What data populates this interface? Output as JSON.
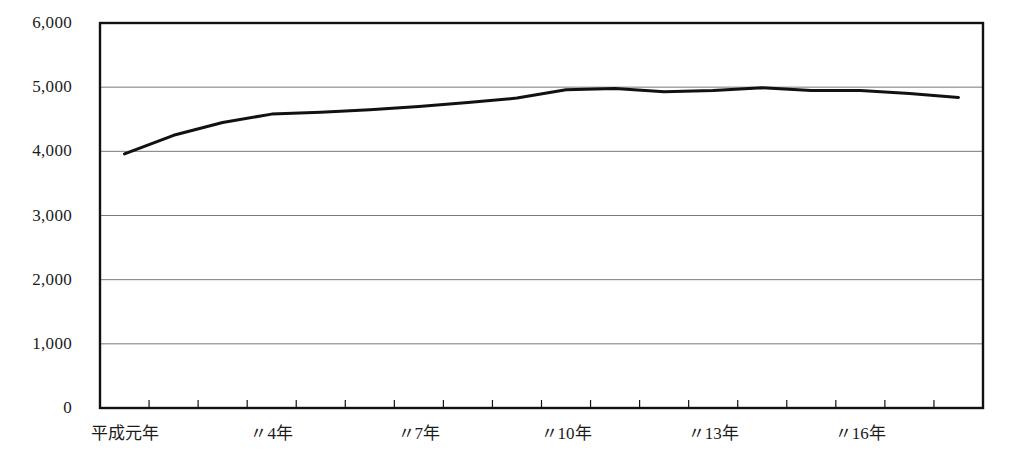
{
  "chart_data": {
    "type": "line",
    "title": "",
    "subtitle": "",
    "xlabel": "",
    "ylabel": "",
    "ylim": [
      0,
      6000
    ],
    "ytick_values": [
      0,
      1000,
      2000,
      3000,
      4000,
      5000,
      6000
    ],
    "ytick_labels": [
      "0",
      "1,000",
      "2,000",
      "3,000",
      "4,000",
      "5,000",
      "6,000"
    ],
    "grid": true,
    "grid_axis": "y",
    "legend": false,
    "legend_position": "none",
    "x_categories": [
      "平成元年",
      "2年",
      "3年",
      "〃4年",
      "5年",
      "6年",
      "〃7年",
      "8年",
      "9年",
      "〃10年",
      "11年",
      "12年",
      "〃13年",
      "14年",
      "15年",
      "〃16年",
      "17年",
      "18年"
    ],
    "xtick_labels": [
      {
        "label": "平成元年",
        "index": 0
      },
      {
        "label": "〃4年",
        "index": 3
      },
      {
        "label": "〃7年",
        "index": 6
      },
      {
        "label": "〃10年",
        "index": 9
      },
      {
        "label": "〃13年",
        "index": 12
      },
      {
        "label": "〃16年",
        "index": 15
      }
    ],
    "series": [
      {
        "name": "series-1",
        "color": "#111111",
        "values": [
          3960,
          4250,
          4450,
          4580,
          4610,
          4650,
          4700,
          4760,
          4830,
          4960,
          4980,
          4930,
          4950,
          4990,
          4950,
          4950,
          4900,
          4840
        ]
      }
    ]
  },
  "axis": {
    "frame_color": "#111111",
    "grid_color": "#7a7a7a",
    "plot_left": 100,
    "plot_right": 983,
    "plot_top": 23,
    "plot_bottom": 408
  }
}
